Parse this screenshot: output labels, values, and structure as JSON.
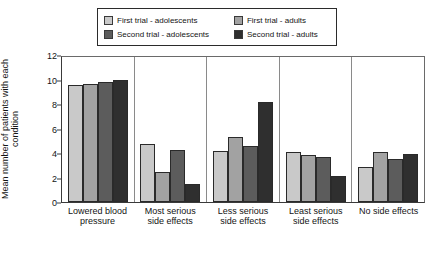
{
  "chart_data": {
    "type": "bar",
    "title": "",
    "xlabel": "",
    "ylabel": "Mean number of patients with each condition",
    "ylim": [
      0,
      12
    ],
    "yticks": [
      0,
      2,
      4,
      6,
      8,
      10,
      12
    ],
    "grid": false,
    "legend_position": "top",
    "categories": [
      "Lowered blood pressure",
      "Most serious side effects",
      "Less serious side effects",
      "Least serious side effects",
      "No side effects"
    ],
    "series": [
      {
        "name": "First trial - adolescents",
        "color": "#c9c9c9",
        "values": [
          9.7,
          4.8,
          4.2,
          4.1,
          2.9
        ]
      },
      {
        "name": "First trial - adults",
        "color": "#a2a2a2",
        "values": [
          9.8,
          2.5,
          5.4,
          3.9,
          4.15
        ]
      },
      {
        "name": "Second trial - adolescents",
        "color": "#5c5c5c",
        "values": [
          9.9,
          4.3,
          4.6,
          3.7,
          3.6
        ]
      },
      {
        "name": "Second trial - adults",
        "color": "#2f2f2f",
        "values": [
          10.1,
          1.5,
          8.3,
          2.15,
          4.0
        ]
      }
    ]
  },
  "legend": {
    "items": [
      {
        "label": "First trial - adolescents",
        "color": "#c9c9c9"
      },
      {
        "label": "First trial - adults",
        "color": "#a2a2a2"
      },
      {
        "label": "Second trial - adolescents",
        "color": "#5c5c5c"
      },
      {
        "label": "Second trial - adults",
        "color": "#2f2f2f"
      }
    ]
  },
  "axis": {
    "y_label": "Mean number of patients with each condition",
    "y_ticks": [
      "12",
      "10",
      "8",
      "6",
      "4",
      "2",
      "0"
    ],
    "x_labels": [
      "Lowered blood pressure",
      "Most serious side effects",
      "Less serious side effects",
      "Least serious side effects",
      "No side effects"
    ]
  }
}
